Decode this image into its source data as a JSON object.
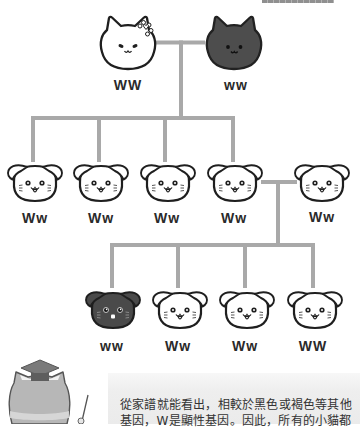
{
  "colors": {
    "connector_line": "#a9a9a9",
    "outline": "#1f1f1f",
    "black_cat_fill": "#4d4d4d",
    "white_cat_fill": "#ffffff",
    "teacher_cat_fill": "#b7b7b7",
    "caption_bg": "#ececec",
    "caption_text": "#333333"
  },
  "pedigree": {
    "parents": [
      {
        "icon": "white-cat-with-bow-icon",
        "coat": "white",
        "label": "WW"
      },
      {
        "icon": "black-cat-icon",
        "coat": "black",
        "label": "ww"
      }
    ],
    "generation_2": [
      {
        "icon": "white-fold-kitten-icon",
        "coat": "white",
        "label": "Ww"
      },
      {
        "icon": "white-fold-kitten-icon",
        "coat": "white",
        "label": "Ww"
      },
      {
        "icon": "white-fold-kitten-icon",
        "coat": "white",
        "label": "Ww"
      },
      {
        "icon": "white-fold-kitten-icon",
        "coat": "white",
        "label": "Ww"
      },
      {
        "icon": "white-fold-kitten-icon",
        "coat": "white",
        "label": "Ww"
      }
    ],
    "generation_3": [
      {
        "icon": "black-fold-kitten-icon",
        "coat": "black",
        "label": "ww"
      },
      {
        "icon": "white-fold-kitten-icon",
        "coat": "white",
        "label": "Ww"
      },
      {
        "icon": "white-fold-kitten-icon",
        "coat": "white",
        "label": "Ww"
      },
      {
        "icon": "white-fold-kitten-icon",
        "coat": "white",
        "label": "WW"
      }
    ]
  },
  "mascot": {
    "icon": "teacher-cat-with-mortarboard-icon"
  },
  "caption": {
    "lines": [
      "從家譜就能看出，相較於黑色或褐色等其他",
      "基因，W是顯性基因。因此，所有的小貓都"
    ]
  }
}
